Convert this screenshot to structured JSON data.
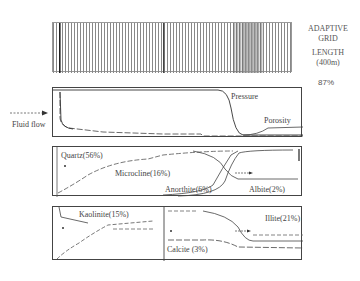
{
  "grid": {
    "title_line1": "ADAPTIVE",
    "title_line2": "GRID",
    "length_line1": "LENGTH",
    "length_line2": "(400m)"
  },
  "percent": "87%",
  "fluid_flow": "Fluid flow",
  "panel1": {
    "pressure": "Pressure",
    "porosity": "Porosity"
  },
  "panel2": {
    "quartz": "Quartz(56%)",
    "microcline": "Microcline(16%)",
    "anorthite": "Anorthite(6%)",
    "albite": "Albite(2%)"
  },
  "panel3": {
    "kaolinite": "Kaolinite(15%)",
    "calcite": "Calcite (3%)",
    "illite": "Illite(21%)"
  }
}
